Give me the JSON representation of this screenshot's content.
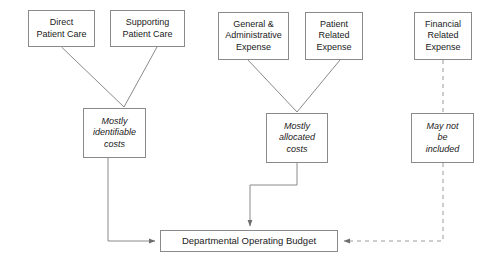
{
  "diagram": {
    "background_color": "#ffffff",
    "line_color": "#8a8a8a",
    "text_color": "#1a1a1a",
    "nodes": {
      "direct_patient_care": "Direct\nPatient Care",
      "supporting_patient_care": "Supporting\nPatient Care",
      "general_administrative_expense": "General &\nAdministrative\nExpense",
      "patient_related_expense": "Patient\nRelated\nExpense",
      "financial_related_expense": "Financial\nRelated\nExpense",
      "mostly_identifiable_costs": "Mostly\nidentifiable\ncosts",
      "mostly_allocated_costs": "Mostly\nallocated\ncosts",
      "may_not_be_included": "May not\nbe\nincluded",
      "departmental_operating_budget": "Departmental Operating Budget"
    },
    "edges": [
      {
        "name": "direct-patient-care-to-identifiable",
        "style": "solid",
        "arrow": false
      },
      {
        "name": "supporting-patient-care-to-identifiable",
        "style": "solid",
        "arrow": false
      },
      {
        "name": "general-administrative-to-allocated",
        "style": "solid",
        "arrow": false
      },
      {
        "name": "patient-related-to-allocated",
        "style": "solid",
        "arrow": false
      },
      {
        "name": "financial-related-to-may-not-be-included",
        "style": "dashed",
        "arrow": false
      },
      {
        "name": "identifiable-costs-to-budget",
        "style": "solid",
        "arrow": true
      },
      {
        "name": "allocated-costs-to-budget",
        "style": "solid",
        "arrow": true
      },
      {
        "name": "may-not-be-included-to-budget",
        "style": "dashed",
        "arrow": true
      }
    ]
  }
}
